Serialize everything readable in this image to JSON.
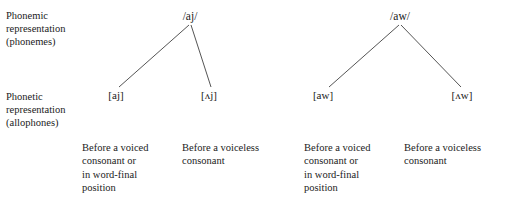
{
  "diagram": {
    "title_hidden": "",
    "row_labels": [
      {
        "name": "phonemic-representation-label",
        "text": "Phonemic\nrepresentation\n(phonemes)"
      },
      {
        "name": "phonetic-representation-label",
        "text": "Phonetic\nrepresentation\n(allophones)"
      }
    ],
    "trees": [
      {
        "phoneme": "/aj/",
        "allophones": [
          "[aj]",
          "[ʌj]"
        ],
        "environments": [
          "Before a voiced\nconsonant or\nin word-final\nposition",
          "Before a voiceless\nconsonant"
        ]
      },
      {
        "phoneme": "/aw/",
        "allophones": [
          "[aw]",
          "[ʌw]"
        ],
        "environments": [
          "Before a voiced\nconsonant or\nin word-final\nposition",
          "Before a voiceless\nconsonant"
        ]
      }
    ],
    "colors": {
      "background": "#ffffff",
      "text": "#1b1b1b",
      "branch_line": "#555555"
    }
  }
}
